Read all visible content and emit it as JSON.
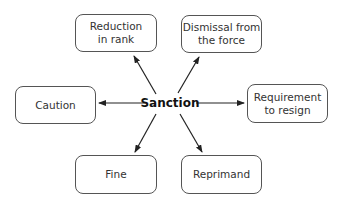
{
  "diagram": {
    "center": {
      "label": "Sanction",
      "x": 170,
      "y": 103
    },
    "nodes": [
      {
        "id": "reduction",
        "label": "Reduction\nin rank",
        "x": 75,
        "y": 14,
        "w": 82,
        "h": 38
      },
      {
        "id": "dismissal",
        "label": "Dismissal from\nthe force",
        "x": 181,
        "y": 15,
        "w": 81,
        "h": 38
      },
      {
        "id": "caution",
        "label": "Caution",
        "x": 15,
        "y": 86,
        "w": 81,
        "h": 38
      },
      {
        "id": "resign",
        "label": "Requirement\nto resign",
        "x": 247,
        "y": 84,
        "w": 81,
        "h": 39
      },
      {
        "id": "fine",
        "label": "Fine",
        "x": 75,
        "y": 155,
        "w": 82,
        "h": 39
      },
      {
        "id": "reprimand",
        "label": "Reprimand",
        "x": 181,
        "y": 155,
        "w": 81,
        "h": 39
      }
    ],
    "edges": [
      {
        "from": "center",
        "to": "reduction",
        "x1": 156,
        "y1": 94,
        "x2": 134,
        "y2": 56
      },
      {
        "from": "center",
        "to": "dismissal",
        "x1": 178,
        "y1": 93,
        "x2": 199,
        "y2": 57
      },
      {
        "from": "center",
        "to": "caution",
        "x1": 146,
        "y1": 103,
        "x2": 99,
        "y2": 103
      },
      {
        "from": "center",
        "to": "resign",
        "x1": 196,
        "y1": 103,
        "x2": 244,
        "y2": 103
      },
      {
        "from": "center",
        "to": "fine",
        "x1": 156,
        "y1": 114,
        "x2": 135,
        "y2": 152
      },
      {
        "from": "center",
        "to": "reprimand",
        "x1": 180,
        "y1": 114,
        "x2": 202,
        "y2": 152
      }
    ]
  }
}
